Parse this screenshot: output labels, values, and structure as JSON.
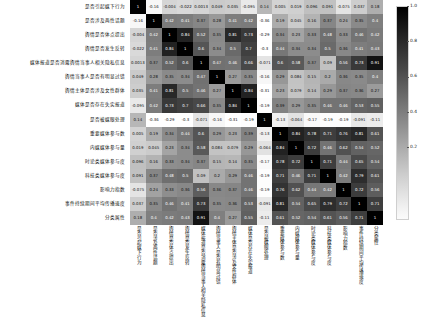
{
  "chart_data": {
    "type": "heatmap",
    "title": "",
    "xlabel": "",
    "ylabel": "",
    "grid": false,
    "legend_position": "right",
    "colormap": "grayscale-reversed",
    "colorbar": {
      "ticks": [
        "1.0",
        "0.8",
        "0.6",
        "0.4",
        "0.2"
      ],
      "tick_positions": [
        1.0,
        0.8,
        0.6,
        0.4,
        0.2
      ],
      "vmin": -0.2,
      "vmax": 1.0
    },
    "categories": [
      "是否引起媒下行为",
      "是否涉及两性话题",
      "舆情是否体点提出",
      "舆情是否发生反转",
      "媒体报道是否消露舆情当事人相关隐私信息",
      "舆情当事人是否有明显过错",
      "舆情主体是否涉及女性群体",
      "媒体是否存在失实报道",
      "是否被媒眼处理",
      "重要媒体参与数",
      "内媒媒体参与量",
      "时论类媒体参与度",
      "科技类媒体参与度",
      "影响力指数",
      "事件持续期间平均传播速度",
      "分类属性"
    ],
    "x_categories": [
      "是否引起媒下行为",
      "是否涉及两性话题",
      "舆情是否体点提出",
      "舆情是否发生反转",
      "媒体报道是否消露舆情当事人相关隐私信息",
      "舆情当事人是否有明显过错",
      "舆情主体是否涉及女性群体",
      "媒体是否存在失实报道",
      "是否被媒眼处理",
      "重要媒体参与数",
      "内媒媒体参与量",
      "时论类媒体参与度",
      "科技类媒体参与度",
      "影响力指数",
      "事件持续期间平均传播速度",
      "分类属性"
    ],
    "matrix": [
      [
        1,
        -0.16,
        -0.004,
        -0.022,
        0.0013,
        0.049,
        0.035,
        -0.095,
        0.14,
        0.005,
        0.019,
        0.096,
        0.091,
        -0.075,
        0.037,
        0.18
      ],
      [
        -0.16,
        1,
        0.42,
        0.41,
        0.37,
        0.28,
        0.41,
        0.42,
        -0.36,
        0.19,
        0.045,
        0.16,
        0.37,
        0.24,
        0.35,
        0.4
      ],
      [
        -0.004,
        0.42,
        1,
        0.84,
        0.52,
        0.35,
        0.81,
        0.73,
        -0.29,
        0.34,
        0.23,
        0.33,
        0.48,
        0.33,
        0.46,
        0.42
      ],
      [
        -0.022,
        0.41,
        0.84,
        1,
        0.6,
        0.34,
        0.5,
        0.7,
        -0.3,
        0.44,
        0.34,
        0.34,
        0.5,
        0.36,
        0.41,
        0.43
      ],
      [
        0.0013,
        0.37,
        0.52,
        0.6,
        1,
        0.47,
        0.46,
        0.66,
        -0.071,
        0.6,
        0.58,
        0.37,
        0.09,
        0.56,
        0.73,
        0.91
      ],
      [
        0.049,
        0.28,
        0.35,
        0.34,
        0.47,
        1,
        0.27,
        0.35,
        -0.16,
        0.29,
        0.084,
        0.15,
        0.2,
        0.36,
        0.35,
        0.4
      ],
      [
        0.035,
        0.41,
        0.81,
        0.5,
        0.46,
        0.27,
        1,
        0.84,
        -0.31,
        0.23,
        0.079,
        0.14,
        0.29,
        0.37,
        0.36,
        0.27
      ],
      [
        -0.095,
        0.42,
        0.73,
        0.7,
        0.66,
        0.35,
        0.84,
        1,
        -0.19,
        0.39,
        0.29,
        0.35,
        0.46,
        0.46,
        0.53,
        0.55
      ],
      [
        0.14,
        -0.36,
        -0.29,
        -0.3,
        -0.071,
        -0.16,
        -0.31,
        -0.19,
        1,
        -0.13,
        -0.064,
        -0.17,
        -0.19,
        -0.19,
        -0.091,
        -0.11
      ],
      [
        0.005,
        0.19,
        0.34,
        0.44,
        0.6,
        0.29,
        0.23,
        0.39,
        -0.13,
        1,
        0.84,
        0.78,
        0.71,
        0.76,
        0.81,
        0.61
      ],
      [
        0.019,
        0.045,
        0.23,
        0.34,
        0.58,
        0.084,
        0.079,
        0.29,
        -0.064,
        0.84,
        1,
        0.72,
        0.46,
        0.62,
        0.54,
        0.52
      ],
      [
        0.096,
        0.16,
        0.33,
        0.34,
        0.37,
        0.15,
        0.14,
        0.35,
        -0.17,
        0.78,
        0.72,
        1,
        0.71,
        0.44,
        0.65,
        0.54
      ],
      [
        0.091,
        0.37,
        0.48,
        0.5,
        0.09,
        0.2,
        0.29,
        0.46,
        -0.19,
        0.71,
        0.46,
        0.71,
        1,
        0.42,
        0.79,
        0.61
      ],
      [
        -0.075,
        0.24,
        0.33,
        0.36,
        0.56,
        0.36,
        0.37,
        0.46,
        -0.19,
        0.76,
        0.62,
        0.44,
        0.42,
        1,
        0.72,
        0.56
      ],
      [
        0.037,
        0.35,
        0.46,
        0.41,
        0.73,
        0.35,
        0.36,
        0.53,
        -0.091,
        0.81,
        0.54,
        0.65,
        0.79,
        0.72,
        1,
        0.71
      ],
      [
        0.18,
        0.4,
        0.42,
        0.43,
        0.91,
        0.4,
        0.27,
        0.55,
        -0.11,
        0.61,
        0.52,
        0.54,
        0.61,
        0.56,
        0.71,
        1
      ]
    ],
    "cell_text": [
      [
        "1",
        "-0.16",
        "-0.004",
        "-0.022",
        "0.0013",
        "0.049",
        "0.035",
        "-0.095",
        "0.14",
        "0.005",
        "0.019",
        "0.096",
        "0.091",
        "-0.075",
        "0.037",
        "0.18"
      ],
      [
        "-0.16",
        "1",
        "0.42",
        "0.41",
        "0.37",
        "0.28",
        "0.41",
        "0.42",
        "-0.36",
        "0.19",
        "0.045",
        "0.16",
        "0.37",
        "0.24",
        "0.35",
        "0.4"
      ],
      [
        "-0.004",
        "0.42",
        "1",
        "0.84",
        "0.52",
        "0.35",
        "0.81",
        "0.73",
        "-0.29",
        "0.34",
        "0.23",
        "0.33",
        "0.48",
        "0.33",
        "0.46",
        "0.42"
      ],
      [
        "-0.022",
        "0.41",
        "0.84",
        "1",
        "0.6",
        "0.34",
        "0.5",
        "0.7",
        "-0.3",
        "0.44",
        "0.34",
        "0.34",
        "0.5",
        "0.36",
        "0.41",
        "0.43"
      ],
      [
        "0.0013",
        "0.37",
        "0.52",
        "0.6",
        "1",
        "0.47",
        "0.46",
        "0.66",
        "-0.071",
        "0.6",
        "0.58",
        "0.37",
        "0.09",
        "0.56",
        "0.73",
        "0.91"
      ],
      [
        "0.049",
        "0.28",
        "0.35",
        "0.34",
        "0.47",
        "1",
        "0.27",
        "0.35",
        "-0.16",
        "0.29",
        "0.084",
        "0.15",
        "0.2",
        "0.36",
        "0.35",
        "0.4"
      ],
      [
        "0.035",
        "0.41",
        "0.81",
        "0.5",
        "0.46",
        "0.27",
        "1",
        "0.84",
        "-0.31",
        "0.23",
        "0.079",
        "0.14",
        "0.29",
        "0.37",
        "0.36",
        "0.27"
      ],
      [
        "-0.095",
        "0.42",
        "0.73",
        "0.7",
        "0.66",
        "0.35",
        "0.84",
        "1",
        "-0.19",
        "0.39",
        "0.29",
        "0.35",
        "0.46",
        "0.46",
        "0.53",
        "0.55"
      ],
      [
        "0.14",
        "-0.36",
        "-0.29",
        "-0.3",
        "-0.071",
        "-0.16",
        "-0.31",
        "-0.19",
        "1",
        "-0.13",
        "-0.064",
        "-0.17",
        "-0.19",
        "-0.19",
        "-0.091",
        "-0.11"
      ],
      [
        "0.005",
        "0.19",
        "0.34",
        "0.44",
        "0.6",
        "0.29",
        "0.23",
        "0.39",
        "-0.13",
        "1",
        "0.84",
        "0.78",
        "0.71",
        "0.76",
        "0.81",
        "0.61"
      ],
      [
        "0.019",
        "0.045",
        "0.23",
        "0.34",
        "0.58",
        "0.084",
        "0.079",
        "0.29",
        "-0.064",
        "0.84",
        "1",
        "0.72",
        "0.46",
        "0.62",
        "0.54",
        "0.52"
      ],
      [
        "0.096",
        "0.16",
        "0.33",
        "0.34",
        "0.37",
        "0.15",
        "0.14",
        "0.35",
        "-0.17",
        "0.78",
        "0.72",
        "1",
        "0.71",
        "0.44",
        "0.65",
        "0.54"
      ],
      [
        "0.091",
        "0.37",
        "0.48",
        "0.5",
        "0.09",
        "0.2",
        "0.29",
        "0.46",
        "-0.19",
        "0.71",
        "0.46",
        "0.71",
        "1",
        "0.42",
        "0.79",
        "0.61"
      ],
      [
        "-0.075",
        "0.24",
        "0.33",
        "0.36",
        "0.56",
        "0.36",
        "0.37",
        "0.46",
        "-0.19",
        "0.76",
        "0.62",
        "0.44",
        "0.42",
        "1",
        "0.72",
        "0.56"
      ],
      [
        "0.037",
        "0.35",
        "0.46",
        "0.41",
        "0.73",
        "0.35",
        "0.36",
        "0.53",
        "-0.091",
        "0.81",
        "0.54",
        "0.65",
        "0.79",
        "0.72",
        "1",
        "0.71"
      ],
      [
        "0.18",
        "0.4",
        "0.42",
        "0.43",
        "0.91",
        "0.4",
        "0.27",
        "0.55",
        "-0.11",
        "0.61",
        "0.52",
        "0.54",
        "0.61",
        "0.56",
        "0.71",
        "1"
      ]
    ]
  }
}
